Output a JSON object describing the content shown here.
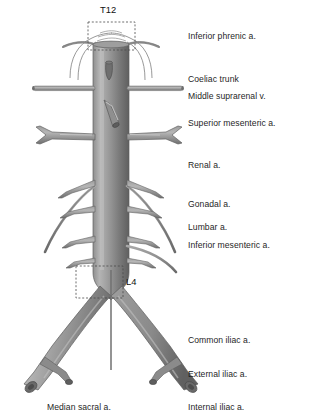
{
  "figure": {
    "title_alt": "Abdominal aorta and its branches",
    "palette": {
      "vessel_light": "#b9b9b9",
      "vessel_mid": "#8d8d8d",
      "vessel_dark": "#636363",
      "outline": "#5a5a5a",
      "text": "#1f1f1f",
      "dashed_box": "#4a4a4a",
      "background": "#ffffff"
    },
    "vertebra_markers": [
      {
        "id": "t12",
        "label": "T12",
        "box": {
          "x": 88,
          "y": 22,
          "w": 47,
          "h": 28
        },
        "label_pos": {
          "x": 100,
          "y": 4
        }
      },
      {
        "id": "l4",
        "label": "L4",
        "box": {
          "x": 76,
          "y": 266,
          "w": 47,
          "h": 32
        },
        "label_pos": {
          "x": 126,
          "y": 278
        }
      }
    ],
    "labels_right": [
      {
        "id": "inferior-phrenic",
        "text": "Inferior phrenic a.",
        "x": 188,
        "y": 31
      },
      {
        "id": "coeliac-trunk",
        "text": "Coeliac trunk",
        "x": 188,
        "y": 74
      },
      {
        "id": "middle-suprarenal",
        "text": "Middle suprarenal v.",
        "x": 188,
        "y": 91
      },
      {
        "id": "superior-mesenteric",
        "text": "Superior mesenteric a.",
        "x": 188,
        "y": 118
      },
      {
        "id": "renal",
        "text": "Renal a.",
        "x": 188,
        "y": 160
      },
      {
        "id": "gonadal",
        "text": "Gonadal a.",
        "x": 188,
        "y": 199
      },
      {
        "id": "lumbar",
        "text": "Lumbar a.",
        "x": 188,
        "y": 222
      },
      {
        "id": "inferior-mesenteric",
        "text": "Inferior mesenteric a.",
        "x": 188,
        "y": 240
      },
      {
        "id": "common-iliac",
        "text": "Common iliac a.",
        "x": 188,
        "y": 335
      },
      {
        "id": "external-iliac",
        "text": "External iliac a.",
        "x": 188,
        "y": 369
      },
      {
        "id": "internal-iliac",
        "text": "Internal iliac a.",
        "x": 188,
        "y": 402
      }
    ],
    "labels_bottom": [
      {
        "id": "median-sacral",
        "text": "Median sacral a.",
        "x": 47,
        "y": 402
      }
    ]
  }
}
